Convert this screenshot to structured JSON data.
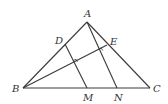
{
  "diagram": {
    "type": "geometry",
    "points": {
      "A": {
        "label": "A",
        "x": 87,
        "y": 22
      },
      "B": {
        "label": "B",
        "x": 23,
        "y": 88
      },
      "C": {
        "label": "C",
        "x": 150,
        "y": 88
      },
      "D": {
        "label": "D",
        "x": 65,
        "y": 44
      },
      "E": {
        "label": "E",
        "x": 107,
        "y": 45
      },
      "M": {
        "label": "M",
        "x": 87,
        "y": 88
      },
      "N": {
        "label": "N",
        "x": 117,
        "y": 88
      }
    },
    "segments": [
      [
        "A",
        "B"
      ],
      [
        "A",
        "C"
      ],
      [
        "B",
        "C"
      ],
      [
        "B",
        "E"
      ],
      [
        "D",
        "M"
      ],
      [
        "A",
        "N"
      ]
    ],
    "right_angle_marks": [
      {
        "at": "intersection of DM and BE"
      },
      {
        "at": "intersection of AN and BE"
      }
    ]
  }
}
